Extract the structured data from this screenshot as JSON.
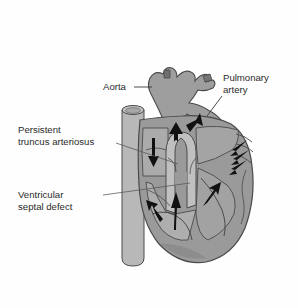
{
  "figure": {
    "background_color": "#fefefe"
  },
  "palette": {
    "heart_muscle_fill": "#9a9a9a",
    "heart_muscle_dark": "#8b8b8b",
    "chamber_fill": "#a8a8a8",
    "chamber_light": "#b4b4b4",
    "vessel_fill": "#a0a0a0",
    "vena_cava_fill": "#b8b8b8",
    "outline": "#4a4a4a",
    "arrow_color": "#111111",
    "label_color": "#2b2b2b",
    "leader_color": "#3a3a3a"
  },
  "labels": {
    "aorta": {
      "text": "Aorta",
      "x": 103,
      "y": 90,
      "anchor": "start"
    },
    "pulmonary_artery": {
      "line1": "Pulmonary",
      "line2": "artery",
      "x": 223,
      "y": 81,
      "anchor": "start"
    },
    "persistent_truncus_arteriosus": {
      "line1": "Persistent",
      "line2": "truncus arteriosus",
      "x": 18,
      "y": 133,
      "anchor": "start"
    },
    "ventricular_septal_defect": {
      "line1": "Ventricular",
      "line2": "septal defect",
      "x": 18,
      "y": 198,
      "anchor": "start"
    }
  },
  "leader_lines": {
    "aorta": "M134,87 L152,87",
    "pulmonary_artery": "M222,96 L207,116",
    "truncus": "M116,143 L175,163",
    "vsd": "M103,195 L188,183"
  },
  "flow_arrows": [
    {
      "name": "right-atrium-down-arrow",
      "direction": "down",
      "region": "right atrium"
    },
    {
      "name": "truncus-up-arrow",
      "direction": "up",
      "region": "outflow tract"
    },
    {
      "name": "pulmonary-branch-arrow",
      "direction": "up-right",
      "region": "pulmonary trunk"
    },
    {
      "name": "left-ventricle-up-arrow",
      "direction": "up-left",
      "region": "left ventricle"
    },
    {
      "name": "septal-up-arrow",
      "direction": "up",
      "region": "ventricular septal defect"
    },
    {
      "name": "left-atrium-inflow-arrow",
      "direction": "up-right",
      "region": "left atrium"
    },
    {
      "name": "pulmonary-vein-arrow-1",
      "direction": "down-left",
      "region": "pulmonary veins"
    },
    {
      "name": "pulmonary-vein-arrow-2",
      "direction": "down-left",
      "region": "pulmonary veins"
    },
    {
      "name": "pulmonary-vein-arrow-3",
      "direction": "down-left",
      "region": "pulmonary veins"
    }
  ]
}
